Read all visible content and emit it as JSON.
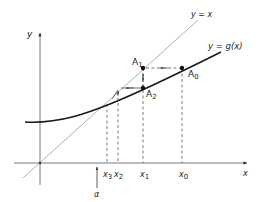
{
  "diagram": {
    "axes": {
      "x_label": "x",
      "y_label": "y"
    },
    "lines": {
      "identity_label": "y = x",
      "curve_label": "y = g(x)"
    },
    "points": [
      {
        "name": "A0",
        "main": "A",
        "sub": "0"
      },
      {
        "name": "A1",
        "main": "A",
        "sub": "1"
      },
      {
        "name": "A2",
        "main": "A",
        "sub": "2"
      }
    ],
    "x_ticks": [
      {
        "main": "x",
        "sub": "3"
      },
      {
        "main": "x",
        "sub": "2"
      },
      {
        "main": "x",
        "sub": "1"
      },
      {
        "main": "x",
        "sub": "0"
      }
    ],
    "fixed_point_label": "α",
    "colors": {
      "ink": "#222222",
      "line_light": "#9a9a9a",
      "curve": "#1a1a1a"
    }
  }
}
